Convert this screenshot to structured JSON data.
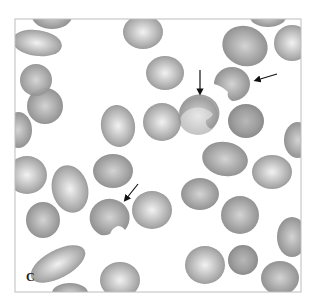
{
  "figure": {
    "panel_label": "C",
    "frame": {
      "x": 15,
      "y": 19,
      "width": 286,
      "height": 273,
      "border_color": "#bdbdbd"
    },
    "colors": {
      "background": "#ffffff",
      "cell_edge": "#8a8a8a",
      "cell_mid": "#a6a6a6",
      "cell_center": "#e8e8e8",
      "arrow": "#111111"
    },
    "arrows": [
      {
        "id": "arrow-1",
        "x1": 200,
        "y1": 70,
        "x2": 200,
        "y2": 94,
        "direction": "down"
      },
      {
        "id": "arrow-2",
        "x1": 277,
        "y1": 74,
        "x2": 255,
        "y2": 81,
        "direction": "left"
      },
      {
        "id": "arrow-3",
        "x1": 138,
        "y1": 184,
        "x2": 124,
        "y2": 201,
        "direction": "down-left"
      }
    ],
    "arrow_count": 3
  }
}
